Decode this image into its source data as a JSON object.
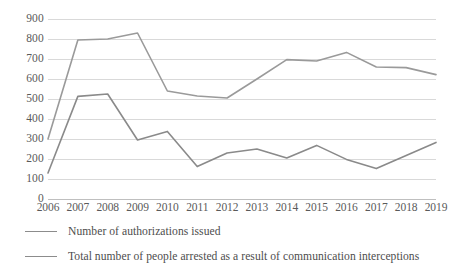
{
  "chart_data": {
    "type": "line",
    "title": "",
    "xlabel": "",
    "ylabel": "",
    "categories": [
      "2006",
      "2007",
      "2008",
      "2009",
      "2010",
      "2011",
      "2012",
      "2013",
      "2014",
      "2015",
      "2016",
      "2017",
      "2018",
      "2019"
    ],
    "ylim": [
      0,
      900
    ],
    "y_ticks": [
      900,
      800,
      700,
      600,
      500,
      400,
      300,
      200,
      100,
      0
    ],
    "grid": true,
    "legend_position": "bottom-left",
    "series": [
      {
        "name": "Number of authorizations issued",
        "color": "#9a9a9a",
        "values": [
          300,
          795,
          800,
          830,
          540,
          515,
          505,
          600,
          697,
          690,
          733,
          660,
          657,
          622
        ]
      },
      {
        "name": "Total number of people arrested as a result of communication interceptions",
        "color": "#8a8a8a",
        "values": [
          130,
          513,
          525,
          295,
          338,
          162,
          230,
          250,
          205,
          268,
          198,
          152,
          218,
          283
        ]
      }
    ]
  },
  "legend": {
    "items": [
      {
        "label": "Number of authorizations issued"
      },
      {
        "label": "Total number of people arrested as a result of communication interceptions"
      }
    ]
  },
  "colors": {
    "gridline": "#d9d9d9",
    "text": "#595959",
    "series_1": "#9a9a9a",
    "series_2": "#8a8a8a"
  }
}
